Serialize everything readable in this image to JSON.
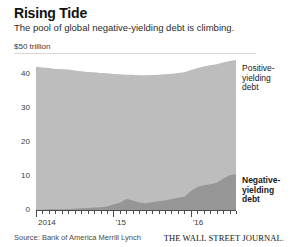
{
  "header": {
    "title": "Rising Tide",
    "subtitle": "The pool of global negative-yielding debt is climbing."
  },
  "footer": {
    "source": "Source: Bank of America Merrill Lynch",
    "publisher": "THE WALL STREET JOURNAL."
  },
  "annotations": {
    "positive": "Positive-\nyielding\ndebt",
    "negative": "Negative-\nyielding\ndebt"
  },
  "colors": {
    "positive_area": "#bdbdbd",
    "negative_area": "#969696",
    "axis": "#4a4a4a",
    "rule": "#d8d8d8",
    "text": "#1a1a1a"
  },
  "chart_data": {
    "type": "area",
    "stacked": true,
    "title": "Rising Tide",
    "subtitle": "The pool of global negative-yielding debt is climbing.",
    "unit_label": "$50 trillion",
    "xlabel": "",
    "ylabel": "$ trillion",
    "ylim": [
      0,
      50
    ],
    "yticks": [
      0,
      10,
      20,
      30,
      40
    ],
    "ytick_labels": [
      "0",
      "10",
      "20",
      "30",
      "40"
    ],
    "xlim": [
      "2014-01",
      "2016-08"
    ],
    "xticks": [
      "2014",
      "15",
      "16"
    ],
    "xtick_labels": [
      "2014",
      "'15",
      "'16"
    ],
    "grid": false,
    "legend": "inline-callout",
    "x": [
      "2014-01",
      "2014-02",
      "2014-03",
      "2014-04",
      "2014-05",
      "2014-06",
      "2014-07",
      "2014-08",
      "2014-09",
      "2014-10",
      "2014-11",
      "2014-12",
      "2015-01",
      "2015-02",
      "2015-03",
      "2015-04",
      "2015-05",
      "2015-06",
      "2015-07",
      "2015-08",
      "2015-09",
      "2015-10",
      "2015-11",
      "2015-12",
      "2016-01",
      "2016-02",
      "2016-03",
      "2016-04",
      "2016-05",
      "2016-06",
      "2016-07",
      "2016-08"
    ],
    "series": [
      {
        "name": "Negative-yielding debt",
        "color": "#969696",
        "values": [
          0.1,
          0.1,
          0.2,
          0.2,
          0.2,
          0.3,
          0.4,
          0.5,
          0.6,
          0.7,
          0.8,
          1.0,
          1.6,
          2.1,
          3.2,
          2.8,
          2.2,
          2.0,
          2.3,
          2.6,
          2.8,
          3.2,
          3.6,
          3.9,
          5.5,
          6.8,
          7.3,
          7.6,
          8.0,
          9.2,
          10.2,
          10.5
        ]
      },
      {
        "name": "Positive-yielding debt",
        "color": "#bdbdbd",
        "values": [
          42.0,
          41.8,
          41.6,
          41.3,
          41.2,
          41.0,
          40.6,
          40.3,
          40.0,
          39.8,
          39.5,
          39.2,
          38.4,
          37.8,
          36.6,
          37.0,
          37.4,
          37.6,
          37.4,
          37.2,
          37.1,
          36.9,
          36.7,
          36.6,
          35.7,
          34.9,
          34.9,
          35.0,
          34.9,
          34.2,
          33.6,
          33.6
        ]
      }
    ],
    "totals": [
      42.1,
      41.9,
      41.8,
      41.5,
      41.4,
      41.3,
      41.0,
      40.8,
      40.6,
      40.5,
      40.3,
      40.2,
      40.0,
      39.9,
      39.8,
      39.8,
      39.6,
      39.6,
      39.7,
      39.8,
      39.9,
      40.1,
      40.3,
      40.5,
      41.2,
      41.7,
      42.2,
      42.6,
      42.9,
      43.4,
      43.8,
      44.1
    ]
  }
}
